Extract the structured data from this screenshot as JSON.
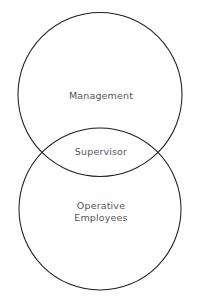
{
  "diagram": {
    "type": "venn-two-circle-vertical",
    "background_color": "#ffffff",
    "stroke_color": "#1e1e23",
    "text_color": "#55555a",
    "circles": [
      {
        "name": "management-circle",
        "label": "Management",
        "cx": 100,
        "cy": 94.5,
        "r": 82.0
      },
      {
        "name": "operative-employees-circle",
        "label": "Operative\nEmployees",
        "cx": 100,
        "cy": 209.0,
        "r": 81.0
      }
    ],
    "overlap": {
      "name": "supervisor-overlap",
      "label": "Supervisor"
    },
    "labels": {
      "management": "Management",
      "supervisor": "Supervisor",
      "operative_employees": "Operative\nEmployees"
    }
  }
}
